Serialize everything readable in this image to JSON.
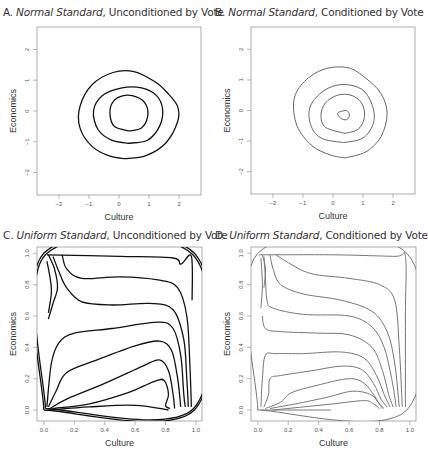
{
  "chart_data": [
    {
      "id": "A",
      "type": "contour",
      "title_prefix": "A.",
      "title_italic": "Normal Standard",
      "title_rest": ", Unconditioned by Vote",
      "xlabel": "Culture",
      "ylabel": "Economics",
      "xlim": [
        -2.73,
        2.73
      ],
      "ylim": [
        -2.73,
        2.73
      ],
      "xticks": [
        -2,
        -1,
        0,
        1,
        2
      ],
      "yticks": [
        -2,
        -1,
        0,
        1,
        2
      ],
      "line_color": "#111111",
      "contours": [
        [
          [
            0.35,
            -0.65
          ],
          [
            0.75,
            -0.55
          ],
          [
            0.95,
            -0.2
          ],
          [
            0.9,
            0.2
          ],
          [
            0.6,
            0.45
          ],
          [
            0.15,
            0.5
          ],
          [
            -0.2,
            0.3
          ],
          [
            -0.3,
            -0.1
          ],
          [
            -0.15,
            -0.5
          ],
          [
            0.35,
            -0.65
          ]
        ],
        [
          [
            0.3,
            -1.05
          ],
          [
            0.95,
            -0.95
          ],
          [
            1.35,
            -0.5
          ],
          [
            1.45,
            0.05
          ],
          [
            1.25,
            0.5
          ],
          [
            0.75,
            0.75
          ],
          [
            0.1,
            0.75
          ],
          [
            -0.55,
            0.5
          ],
          [
            -0.85,
            0.0
          ],
          [
            -0.7,
            -0.6
          ],
          [
            -0.25,
            -0.95
          ],
          [
            0.3,
            -1.05
          ]
        ],
        [
          [
            0.2,
            -1.55
          ],
          [
            0.9,
            -1.45
          ],
          [
            1.55,
            -1.05
          ],
          [
            1.95,
            -0.35
          ],
          [
            1.95,
            0.15
          ],
          [
            1.6,
            0.6
          ],
          [
            1.2,
            0.95
          ],
          [
            0.5,
            1.28
          ],
          [
            -0.2,
            1.25
          ],
          [
            -0.9,
            0.85
          ],
          [
            -1.3,
            0.15
          ],
          [
            -1.3,
            -0.55
          ],
          [
            -0.9,
            -1.15
          ],
          [
            -0.35,
            -1.45
          ],
          [
            0.2,
            -1.55
          ]
        ]
      ]
    },
    {
      "id": "B",
      "type": "contour",
      "title_prefix": "B.",
      "title_italic": "Normal Standard",
      "title_rest": ", Conditioned by Vote",
      "xlabel": "Culture",
      "ylabel": "Economics",
      "xlim": [
        -2.73,
        2.73
      ],
      "ylim": [
        -2.73,
        2.73
      ],
      "xticks": [
        -2,
        -1,
        0,
        1,
        2
      ],
      "yticks": [
        -2,
        -1,
        0,
        1,
        2
      ],
      "line_color": "#666666",
      "contours": [
        [
          [
            0.2,
            -0.05
          ],
          [
            0.45,
            0.0
          ],
          [
            0.55,
            -0.15
          ],
          [
            0.45,
            -0.3
          ],
          [
            0.25,
            -0.25
          ],
          [
            0.15,
            -0.1
          ],
          [
            0.2,
            -0.05
          ]
        ],
        [
          [
            0.4,
            -0.75
          ],
          [
            0.85,
            -0.6
          ],
          [
            1.05,
            -0.2
          ],
          [
            0.95,
            0.25
          ],
          [
            0.6,
            0.5
          ],
          [
            0.15,
            0.5
          ],
          [
            -0.25,
            0.25
          ],
          [
            -0.4,
            -0.15
          ],
          [
            -0.25,
            -0.55
          ],
          [
            0.4,
            -0.75
          ]
        ],
        [
          [
            0.35,
            -1.05
          ],
          [
            1.0,
            -0.9
          ],
          [
            1.35,
            -0.4
          ],
          [
            1.3,
            0.2
          ],
          [
            0.95,
            0.7
          ],
          [
            0.3,
            0.85
          ],
          [
            -0.3,
            0.65
          ],
          [
            -0.75,
            0.15
          ],
          [
            -0.75,
            -0.45
          ],
          [
            -0.4,
            -0.9
          ],
          [
            0.35,
            -1.05
          ]
        ],
        [
          [
            0.4,
            -1.55
          ],
          [
            1.1,
            -1.35
          ],
          [
            1.6,
            -0.85
          ],
          [
            1.8,
            -0.1
          ],
          [
            1.6,
            0.55
          ],
          [
            1.1,
            1.05
          ],
          [
            0.5,
            1.4
          ],
          [
            -0.3,
            1.35
          ],
          [
            -0.95,
            0.95
          ],
          [
            -1.3,
            0.35
          ],
          [
            -1.2,
            -0.5
          ],
          [
            -0.7,
            -1.15
          ],
          [
            -0.1,
            -1.45
          ],
          [
            0.4,
            -1.55
          ]
        ]
      ]
    },
    {
      "id": "C",
      "type": "contour",
      "title_prefix": "C.",
      "title_italic": "Uniform Standard",
      "title_rest": ", Unconditioned by Vote",
      "xlabel": "Culture",
      "ylabel": "Economics",
      "xlim": [
        -0.045,
        1.04
      ],
      "ylim": [
        -0.07,
        1.04
      ],
      "xticks": [
        0.0,
        0.2,
        0.4,
        0.6,
        0.8,
        1.0
      ],
      "yticks": [
        0.0,
        0.2,
        0.4,
        0.6,
        0.8,
        1.0
      ],
      "xtick_labels": [
        "0.0",
        "0.2",
        "0.4",
        "0.6",
        "0.8",
        "1.0"
      ],
      "ytick_labels": [
        "0.0",
        "0.2",
        "0.4",
        "0.6",
        "0.8",
        "1.0"
      ],
      "line_color": "#111111",
      "contours": [
        [
          [
            0.0,
            0.0
          ],
          [
            0.0,
            1.0
          ],
          [
            0.99,
            1.0
          ],
          [
            0.99,
            0.0
          ],
          [
            0.0,
            0.0
          ]
        ],
        [
          [
            0.01,
            0.01
          ],
          [
            0.01,
            0.99
          ],
          [
            0.98,
            0.99
          ],
          [
            0.985,
            0.01
          ],
          [
            0.01,
            0.01
          ]
        ],
        [
          [
            0.02,
            0.99
          ],
          [
            0.5,
            0.98
          ],
          [
            0.85,
            0.97
          ],
          [
            0.9,
            0.93
          ],
          [
            0.97,
            0.98
          ],
          [
            0.975,
            0.7
          ]
        ],
        [
          [
            0.12,
            0.99
          ],
          [
            0.15,
            0.9
          ],
          [
            0.25,
            0.84
          ],
          [
            0.5,
            0.85
          ],
          [
            0.75,
            0.83
          ],
          [
            0.88,
            0.78
          ],
          [
            0.94,
            0.6
          ],
          [
            0.96,
            0.3
          ],
          [
            0.97,
            0.02
          ]
        ],
        [
          [
            0.06,
            0.98
          ],
          [
            0.1,
            0.88
          ],
          [
            0.15,
            0.78
          ],
          [
            0.25,
            0.69
          ],
          [
            0.45,
            0.67
          ],
          [
            0.7,
            0.68
          ],
          [
            0.85,
            0.64
          ],
          [
            0.92,
            0.45
          ],
          [
            0.94,
            0.2
          ],
          [
            0.95,
            0.02
          ]
        ],
        [
          [
            0.02,
            0.02
          ],
          [
            0.05,
            0.3
          ],
          [
            0.1,
            0.43
          ],
          [
            0.2,
            0.49
          ],
          [
            0.45,
            0.52
          ],
          [
            0.75,
            0.56
          ],
          [
            0.85,
            0.52
          ],
          [
            0.9,
            0.35
          ],
          [
            0.92,
            0.1
          ],
          [
            0.93,
            0.02
          ]
        ],
        [
          [
            0.03,
            0.02
          ],
          [
            0.08,
            0.12
          ],
          [
            0.15,
            0.24
          ],
          [
            0.35,
            0.32
          ],
          [
            0.6,
            0.41
          ],
          [
            0.76,
            0.44
          ],
          [
            0.84,
            0.38
          ],
          [
            0.88,
            0.2
          ],
          [
            0.9,
            0.02
          ]
        ],
        [
          [
            0.04,
            0.01
          ],
          [
            0.15,
            0.07
          ],
          [
            0.4,
            0.17
          ],
          [
            0.65,
            0.28
          ],
          [
            0.76,
            0.32
          ],
          [
            0.82,
            0.25
          ],
          [
            0.85,
            0.1
          ],
          [
            0.86,
            0.01
          ]
        ],
        [
          [
            0.06,
            0.01
          ],
          [
            0.3,
            0.04
          ],
          [
            0.55,
            0.11
          ],
          [
            0.72,
            0.18
          ],
          [
            0.79,
            0.19
          ],
          [
            0.82,
            0.1
          ],
          [
            0.8,
            0.03
          ],
          [
            0.83,
            0.01
          ]
        ],
        [
          [
            0.03,
            0.0
          ],
          [
            0.3,
            0.02
          ],
          [
            0.6,
            0.03
          ],
          [
            0.82,
            0.0
          ]
        ],
        [
          [
            0.02,
            0.95
          ],
          [
            0.04,
            0.85
          ],
          [
            0.05,
            0.75
          ],
          [
            0.03,
            0.62
          ]
        ],
        [
          [
            0.03,
            0.99
          ],
          [
            0.07,
            0.9
          ],
          [
            0.09,
            0.78
          ],
          [
            0.06,
            0.68
          ],
          [
            0.03,
            0.58
          ]
        ]
      ]
    },
    {
      "id": "D",
      "type": "contour",
      "title_prefix": "D.",
      "title_italic": "Uniform Standard",
      "title_rest": ", Conditioned by Vote",
      "xlabel": "Culture",
      "ylabel": "Economics",
      "xlim": [
        -0.045,
        1.04
      ],
      "ylim": [
        -0.07,
        1.04
      ],
      "xticks": [
        0.0,
        0.2,
        0.4,
        0.6,
        0.8,
        1.0
      ],
      "yticks": [
        0.0,
        0.2,
        0.4,
        0.6,
        0.8,
        1.0
      ],
      "xtick_labels": [
        "0.0",
        "0.2",
        "0.4",
        "0.6",
        "0.8",
        "1.0"
      ],
      "ytick_labels": [
        "0.0",
        "0.2",
        "0.4",
        "0.6",
        "0.8",
        "1.0"
      ],
      "line_color": "#777777",
      "contours": [
        [
          [
            0.0,
            0.0
          ],
          [
            0.0,
            1.0
          ],
          [
            0.98,
            1.0
          ],
          [
            0.98,
            0.0
          ],
          [
            0.0,
            0.0
          ]
        ],
        [
          [
            0.01,
            0.99
          ],
          [
            0.5,
            0.99
          ],
          [
            0.9,
            0.98
          ],
          [
            0.97,
            0.98
          ],
          [
            0.97,
            0.6
          ],
          [
            0.97,
            0.02
          ]
        ],
        [
          [
            0.12,
            0.99
          ],
          [
            0.2,
            0.94
          ],
          [
            0.35,
            0.87
          ],
          [
            0.6,
            0.84
          ],
          [
            0.8,
            0.8
          ],
          [
            0.9,
            0.7
          ],
          [
            0.93,
            0.4
          ],
          [
            0.95,
            0.02
          ]
        ],
        [
          [
            0.08,
            0.99
          ],
          [
            0.1,
            0.9
          ],
          [
            0.15,
            0.8
          ],
          [
            0.3,
            0.74
          ],
          [
            0.55,
            0.7
          ],
          [
            0.75,
            0.63
          ],
          [
            0.85,
            0.5
          ],
          [
            0.9,
            0.3
          ],
          [
            0.93,
            0.02
          ]
        ],
        [
          [
            0.04,
            0.98
          ],
          [
            0.05,
            0.85
          ],
          [
            0.06,
            0.7
          ],
          [
            0.1,
            0.65
          ],
          [
            0.3,
            0.61
          ],
          [
            0.6,
            0.6
          ],
          [
            0.75,
            0.53
          ],
          [
            0.83,
            0.4
          ],
          [
            0.88,
            0.2
          ],
          [
            0.91,
            0.02
          ]
        ],
        [
          [
            0.03,
            0.6
          ],
          [
            0.05,
            0.52
          ],
          [
            0.15,
            0.5
          ],
          [
            0.4,
            0.49
          ],
          [
            0.6,
            0.48
          ],
          [
            0.75,
            0.4
          ],
          [
            0.82,
            0.25
          ],
          [
            0.86,
            0.1
          ],
          [
            0.89,
            0.02
          ]
        ],
        [
          [
            0.02,
            0.02
          ],
          [
            0.03,
            0.2
          ],
          [
            0.05,
            0.35
          ],
          [
            0.12,
            0.36
          ],
          [
            0.3,
            0.36
          ],
          [
            0.55,
            0.37
          ],
          [
            0.7,
            0.33
          ],
          [
            0.78,
            0.22
          ],
          [
            0.83,
            0.1
          ],
          [
            0.87,
            0.02
          ]
        ],
        [
          [
            0.04,
            0.02
          ],
          [
            0.07,
            0.1
          ],
          [
            0.08,
            0.2
          ],
          [
            0.15,
            0.22
          ],
          [
            0.35,
            0.25
          ],
          [
            0.55,
            0.28
          ],
          [
            0.68,
            0.26
          ],
          [
            0.76,
            0.17
          ],
          [
            0.81,
            0.07
          ],
          [
            0.85,
            0.02
          ]
        ],
        [
          [
            0.05,
            0.01
          ],
          [
            0.15,
            0.05
          ],
          [
            0.22,
            0.11
          ],
          [
            0.4,
            0.16
          ],
          [
            0.6,
            0.2
          ],
          [
            0.7,
            0.17
          ],
          [
            0.76,
            0.1
          ],
          [
            0.8,
            0.04
          ],
          [
            0.83,
            0.01
          ]
        ],
        [
          [
            0.08,
            0.01
          ],
          [
            0.25,
            0.04
          ],
          [
            0.45,
            0.08
          ],
          [
            0.62,
            0.12
          ],
          [
            0.74,
            0.1
          ],
          [
            0.79,
            0.05
          ],
          [
            0.82,
            0.01
          ]
        ],
        [
          [
            0.1,
            0.0
          ],
          [
            0.3,
            0.02
          ],
          [
            0.5,
            0.04
          ],
          [
            0.7,
            0.06
          ],
          [
            0.76,
            0.04
          ],
          [
            0.8,
            0.01
          ]
        ],
        [
          [
            0.02,
            0.0
          ],
          [
            0.3,
            0.0
          ],
          [
            0.48,
            0.0
          ]
        ],
        [
          [
            0.02,
            0.97
          ],
          [
            0.03,
            0.8
          ],
          [
            0.02,
            0.65
          ]
        ],
        [
          [
            0.03,
            0.99
          ],
          [
            0.05,
            0.9
          ],
          [
            0.04,
            0.78
          ]
        ]
      ]
    }
  ]
}
